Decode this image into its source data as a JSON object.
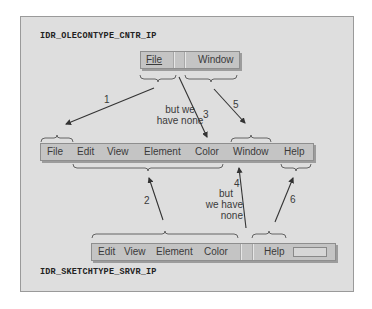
{
  "diagram": {
    "container_menu": {
      "resource_id": "IDR_OLECONTYPE_CNTR_IP",
      "items": [
        "File",
        "",
        "Window"
      ]
    },
    "merged_menu": {
      "items": [
        "File",
        "Edit",
        "View",
        "Element",
        "Color",
        "Window",
        "Help"
      ]
    },
    "server_menu": {
      "resource_id": "IDR_SKETCHTYPE_SRVR_IP",
      "items": [
        "Edit",
        "View",
        "Element",
        "Color",
        "",
        "Help",
        ""
      ]
    },
    "arrows": [
      {
        "number": "1",
        "from": "container File group",
        "to": "merged File"
      },
      {
        "number": "2",
        "from": "server Edit..Color group",
        "to": "merged Edit..Color"
      },
      {
        "number": "3",
        "from": "container empty group",
        "to": "merged Color",
        "note": "but we have none"
      },
      {
        "number": "4",
        "from": "server empty group",
        "to": "merged Window",
        "note": "but we have none"
      },
      {
        "number": "5",
        "from": "container Window group",
        "to": "merged Window"
      },
      {
        "number": "6",
        "from": "server Help group",
        "to": "merged Help"
      }
    ],
    "notes": {
      "arrow3_line1": "but we",
      "arrow3_line2": "have none",
      "arrow4_line1": "but",
      "arrow4_line2": "we have",
      "arrow4_line3": "none"
    },
    "colors": {
      "panel_bg": "#dedede",
      "menubar_bg": "#c4c4c4",
      "arrow": "#333333",
      "text": "#3a3a3a"
    }
  }
}
